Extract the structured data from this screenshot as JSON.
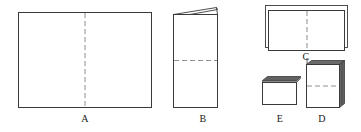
{
  "figure": {
    "background_color": "#ffffff",
    "stroke_color": "#3a3a3a",
    "dash_color": "#8a8a8a",
    "shade_color": "#595959",
    "labels": {
      "a": "A",
      "b": "B",
      "c": "C",
      "d": "D",
      "e": "E"
    },
    "panels": [
      {
        "id": "A",
        "name": "unfolded-sheet",
        "shape": "rectangle",
        "fold_line": "vertical-dashed-center",
        "x": 18,
        "y": 12,
        "width": 134,
        "height": 96
      },
      {
        "id": "B",
        "name": "half-folded-sheet",
        "shape": "rectangle-with-slanted-top-flap",
        "fold_line": "horizontal-dashed-center",
        "x": 173,
        "y": 14,
        "width": 45,
        "height": 94
      },
      {
        "id": "C",
        "name": "stacked-landscape-sheets",
        "shape": "two-offset-rectangles",
        "fold_line": "vertical-dashed-center",
        "x": 265,
        "y": 6,
        "width": 83,
        "height": 45
      },
      {
        "id": "D",
        "name": "stacked-portrait-block",
        "shape": "3d-block-with-side-faces",
        "fold_line": "horizontal-dashed-center",
        "x": 306,
        "y": 64,
        "width": 34,
        "height": 44
      },
      {
        "id": "E",
        "name": "small-landscape-block",
        "shape": "3d-block-with-top-face",
        "fold_line": "none",
        "x": 262,
        "y": 80,
        "width": 38,
        "height": 25
      }
    ]
  }
}
